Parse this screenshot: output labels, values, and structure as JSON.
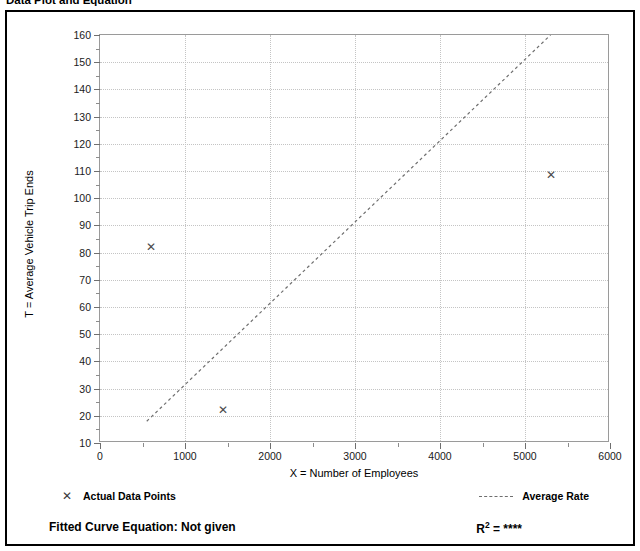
{
  "header": {
    "title": "Data Plot and Equation",
    "right_text": ""
  },
  "legend": {
    "data_points_label": "Actual Data Points",
    "data_points_marker": "x-marker-icon",
    "average_rate_label": "Average Rate",
    "average_rate_marker": "dashed-line-icon"
  },
  "footer": {
    "equation_label": "Fitted Curve Equation:  Not given",
    "r_squared_base": "R",
    "r_squared_exp": "2",
    "r_squared_eq": " = ****"
  },
  "chart_data": {
    "type": "scatter",
    "title": "Data Plot and Equation",
    "xlabel": "X = Number of Employees",
    "ylabel": "T = Average Vehicle Trip Ends",
    "xlim": [
      0,
      6000
    ],
    "ylim": [
      10,
      160
    ],
    "xticks": [
      0,
      1000,
      2000,
      3000,
      4000,
      5000,
      6000
    ],
    "xtick_labels": [
      "0",
      "1000",
      "2000",
      "3000",
      "4000",
      "5000",
      "6000"
    ],
    "xminor_step": 500,
    "yticks": [
      10,
      20,
      30,
      40,
      50,
      60,
      70,
      80,
      90,
      100,
      110,
      120,
      130,
      140,
      150,
      160
    ],
    "ytick_labels": [
      "10",
      "20",
      "30",
      "40",
      "50",
      "60",
      "70",
      "80",
      "90",
      "100",
      "110",
      "120",
      "130",
      "140",
      "150",
      "160"
    ],
    "yminor_step": 5,
    "grid": true,
    "legend_position": "below-plot",
    "series": [
      {
        "name": "Actual Data Points",
        "type": "scatter",
        "marker": "x",
        "color": "#4a4a4a",
        "points": [
          {
            "x": 600,
            "y": 82
          },
          {
            "x": 1450,
            "y": 22
          },
          {
            "x": 5300,
            "y": 108.5
          }
        ]
      },
      {
        "name": "Average Rate",
        "type": "line",
        "style": "dashed",
        "color": "#6e6e6e",
        "points": [
          {
            "x": 550,
            "y": 18
          },
          {
            "x": 5300,
            "y": 160
          }
        ]
      }
    ]
  }
}
